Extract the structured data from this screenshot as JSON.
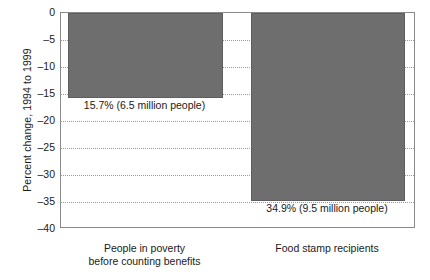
{
  "chart_data": {
    "type": "bar",
    "title": "",
    "xlabel": "",
    "ylabel": "Percent change, 1994 to 1999",
    "ylim": [
      -40,
      0
    ],
    "grid": true,
    "legend": "none",
    "orientation": "vertical-downward",
    "categories": [
      "People in poverty before counting benefits",
      "Food stamp recipients"
    ],
    "category_lines": [
      [
        "People in poverty",
        "before counting benefits"
      ],
      [
        "Food stamp recipients",
        ""
      ]
    ],
    "values": [
      -15.7,
      -34.9
    ],
    "data_labels": [
      "15.7% (6.5 million people)",
      "34.9% (9.5 million people)"
    ],
    "ytick_labels": [
      "0",
      "–5",
      "–10",
      "–15",
      "–20",
      "–25",
      "–30",
      "–35",
      "–40"
    ],
    "ytick_values": [
      0,
      -5,
      -10,
      -15,
      -20,
      -25,
      -30,
      -35,
      -40
    ],
    "colors": {
      "bar_fill": "#6e6e6e",
      "bar_edge": "#5e5e5e",
      "axis": "#8a8a8a",
      "gridline": "#9a9a9a",
      "text": "#1a1a1a",
      "background": "#ffffff"
    }
  }
}
